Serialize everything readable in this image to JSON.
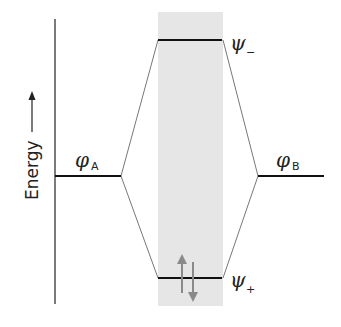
{
  "diagram": {
    "type": "molecular-orbital-energy-diagram",
    "axis": {
      "label": "Energy",
      "arrow": "up"
    },
    "levels": [
      {
        "id": "phi_A",
        "symbol": "φ",
        "subscript": "A",
        "position": "left"
      },
      {
        "id": "phi_B",
        "symbol": "φ",
        "subscript": "B",
        "position": "right"
      },
      {
        "id": "psi_minus",
        "symbol": "ψ",
        "subscript": "−",
        "position": "center-top",
        "label": "antibonding"
      },
      {
        "id": "psi_plus",
        "symbol": "ψ",
        "subscript": "+",
        "position": "center-bottom",
        "label": "bonding",
        "electrons": 2
      }
    ],
    "colors": {
      "shade": "#e6e6e6",
      "level_line": "#111111",
      "connector": "#777777",
      "electron_arrow": "#8a8a8a"
    }
  }
}
